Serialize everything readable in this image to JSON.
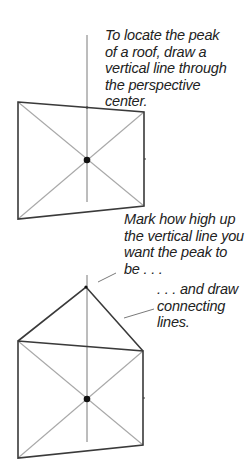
{
  "captions": {
    "step1": "To locate the peak\nof a roof, draw a\nvertical line through\nthe perspective\ncenter.",
    "step2": "Mark how high up\nthe vertical line you\nwant the peak to\nbe . . .",
    "step3": ". . . and draw\nconnecting\nlines."
  },
  "colors": {
    "outline": "#3a3a3a",
    "diagonal": "#a8a8a8",
    "vertical": "#7a7a7a",
    "dot": "#111111",
    "text": "#222222"
  },
  "figures": [
    {
      "name": "rectangle-with-vertical",
      "corners": {
        "tl": [
          18,
          102
        ],
        "tr": [
          144,
          112
        ],
        "br": [
          144,
          206
        ],
        "bl": [
          18,
          219
        ]
      },
      "center": [
        87,
        160
      ],
      "vertical": [
        35,
        202
      ]
    },
    {
      "name": "rectangle-with-roof",
      "corners": {
        "tl": [
          18,
          341
        ],
        "tr": [
          143,
          351
        ],
        "br": [
          143,
          445
        ],
        "bl": [
          18,
          458
        ]
      },
      "center": [
        87,
        399
      ],
      "vertical": [
        275,
        442
      ],
      "peak": [
        86,
        287
      ]
    }
  ]
}
